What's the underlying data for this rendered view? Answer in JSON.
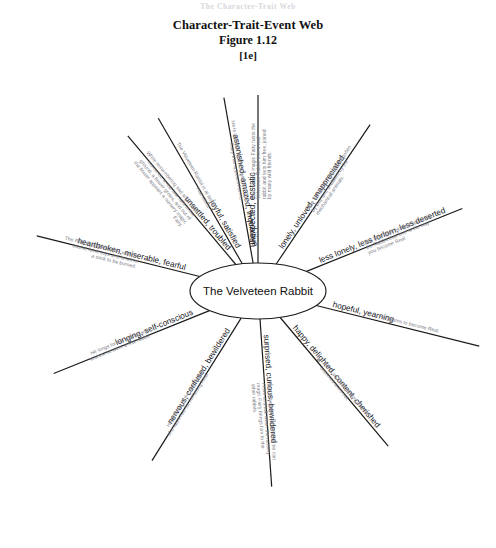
{
  "page": {
    "running_header": "The Character-Trait Web",
    "title": "Character-Trait-Event Web",
    "figure": "Figure 1.12",
    "code": "[1e]"
  },
  "web": {
    "center": "The Velveteen Rabbit",
    "spokes": [
      {
        "id": "spoke-unexpected-ecstatic",
        "trait": "unexpected, ecstatic",
        "event": "The nursery magic Fairy turns the Velveteen Rabbit into a real rabbit and sets him free, joined by many wild friends.",
        "angle": -90
      },
      {
        "id": "spoke-lonely-unloved-unappreciated",
        "trait": "lonely, unloved, unappreciated",
        "event": "The Velveteen Rabbit is forgotten by Boy and snubbed by the mechanical animals.",
        "angle": -56
      },
      {
        "id": "spoke-less-lonely-less-forlorn-less-deserted",
        "trait": "less lonely, less forlorn, less deserted",
        "event": "The wise Skin Horse explains to the Rabbit that love is the way you become Real.",
        "angle": -22
      },
      {
        "id": "spoke-hopeful-yearning",
        "trait": "hopeful, yearning",
        "event": "He yearns to become Real.",
        "angle": 14
      },
      {
        "id": "spoke-happy-delighted-content-cherished",
        "trait": "happy, delighted, content, cherished",
        "event": "He is so loved by Boy that he becomes worn out.",
        "angle": 50
      },
      {
        "id": "spoke-surprised-curious-bewildered",
        "trait": "surprised, curious, bewildered",
        "event": "The Velveteen Rabbit finds he can move and talk when the nursery magic Fairy brings him to the other rabbits.",
        "angle": 86
      },
      {
        "id": "spoke-nervous-confused-bewildered",
        "trait": "nervous, confused, bewildered",
        "event": "He is afraid of the real rabbits who taunt him for not being Real.",
        "angle": 122
      },
      {
        "id": "spoke-longing-self-conscious",
        "trait": "longing, self-conscious",
        "event": "He longs for his soft fur and wishes he were a real rabbit.",
        "angle": 158
      },
      {
        "id": "spoke-heartbroken-miserable-fearful",
        "trait": "heartbroken, miserable, fearful",
        "event": "The Rabbit is taken away with the scarlet fever toys and is left in a sack to be burned.",
        "angle": 194
      },
      {
        "id": "spoke-unsettled-troubled",
        "trait": "unsettled, troubled",
        "event": "While remembering sad and happy moments, a real tear falls to the ground, a flower grows, and out of the flower appears a nursery magic Fairy.",
        "angle": 230
      },
      {
        "id": "spoke-astonished-amazed-inquisitive",
        "trait": "astonished, amazed, inquisitive",
        "event": "He is amazed by the flower and the Fairy that appears from it.",
        "angle": 260
      },
      {
        "id": "spoke-joyful-satisfied",
        "trait": "joyful, satisfied",
        "event": "The Velveteen Rabbit is at last a real rabbit.",
        "angle": -120
      }
    ]
  }
}
